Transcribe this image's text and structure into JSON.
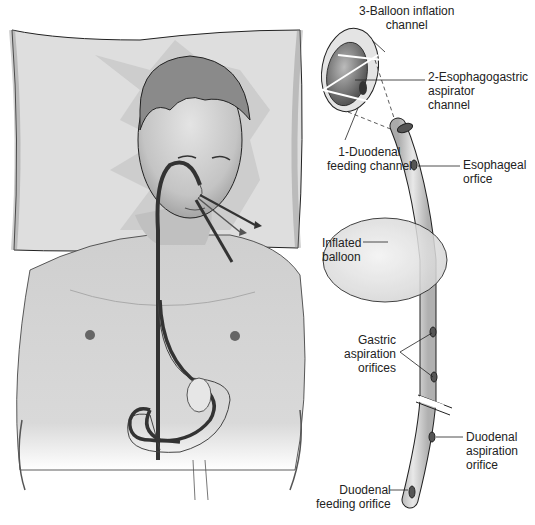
{
  "figure": {
    "labels": {
      "balloon_inflation_channel": "3-Balloon inflation\nchannel",
      "esophagogastric_aspirator_channel": "2-Esophagogastric\naspirator\nchannel",
      "duodenal_feeding_channel": "1-Duodenal\nfeeding channel",
      "esophageal_orifice": "Esophageal\norfice",
      "inflated_balloon": "Inflated\nballoon",
      "gastric_aspiration_orifices": "Gastric\naspiration\norifices",
      "duodenal_aspiration_orifice": "Duodenal\naspiration\norifice",
      "duodenal_feeding_orifice": "Duodenal\nfeeding orifice"
    },
    "colors": {
      "pillow": "#dcdcdc",
      "skin": "#cfcfcf",
      "tube_dark": "#3a3a3a",
      "tube_light": "#d8d8d8",
      "balloon": "#e6e6e6",
      "line": "#222222"
    }
  }
}
